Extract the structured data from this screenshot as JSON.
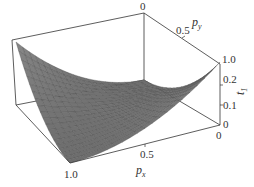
{
  "chart_data": {
    "type": "surface3d",
    "title": "",
    "xlabel": "p_x",
    "ylabel": "p_y",
    "zlabel": "t_1",
    "x_ticks": [
      "0",
      "0.5",
      "1.0"
    ],
    "y_ticks": [
      "0",
      "0.5",
      "1.0"
    ],
    "z_ticks": [
      "0",
      "0.1",
      "0.2"
    ],
    "xlim": [
      0,
      1
    ],
    "ylim": [
      0,
      1
    ],
    "zlim": [
      0,
      0.25
    ],
    "grid_resolution": 20,
    "surface_color": "#7a7a7a",
    "mesh_color": "#4a4a4a",
    "corner_values": [
      {
        "px": 0,
        "py": 0,
        "t1": 0.25
      },
      {
        "px": 0,
        "py": 1,
        "t1": 0.0
      },
      {
        "px": 1,
        "py": 0,
        "t1": 0.0
      },
      {
        "px": 1,
        "py": 1,
        "t1": 0.25
      }
    ]
  },
  "labels": {
    "px_main": "p",
    "px_sub": "x",
    "py_main": "p",
    "py_sub": "y",
    "t1_main": "t",
    "t1_sub": "1",
    "top_zero": "0",
    "py_half": "0.5",
    "py_one": "1.0",
    "z_02": "0.2",
    "z_01": "0.1",
    "z_0": "0",
    "px_zero": "0",
    "px_half": "0.5",
    "px_one": "1.0"
  }
}
